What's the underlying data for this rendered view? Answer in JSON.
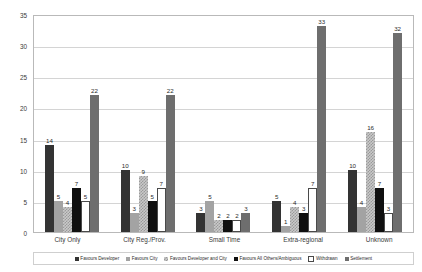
{
  "chart_data": {
    "type": "bar",
    "title": "",
    "subtitle": "",
    "xlabel": "",
    "ylabel": "",
    "ylim": [
      0,
      35
    ],
    "y_ticks": [
      0,
      5,
      10,
      15,
      20,
      25,
      30,
      35
    ],
    "grid": true,
    "legend_position": "bottom",
    "categories": [
      "City Only",
      "City Reg./Prov.",
      "Small Time",
      "Extra-regional",
      "Unknown"
    ],
    "series": [
      {
        "name": "Favours Developer",
        "color": "#333333",
        "values": [
          14,
          10,
          3,
          5,
          10
        ]
      },
      {
        "name": "Favours City",
        "color": "#a3a3a3",
        "values": [
          5,
          3,
          5,
          1,
          4
        ]
      },
      {
        "name": "Favours Developer and City",
        "color": "#c9c9c9",
        "values": [
          4,
          9,
          2,
          4,
          16
        ]
      },
      {
        "name": "Favours All Others/Ambiguous",
        "color": "#101010",
        "values": [
          7,
          5,
          2,
          3,
          7
        ]
      },
      {
        "name": "Withdrawn",
        "color": "#ffffff",
        "values": [
          5,
          7,
          2,
          7,
          3
        ]
      },
      {
        "name": "Settlement",
        "color": "#6e6e6e",
        "values": [
          22,
          22,
          3,
          33,
          32
        ]
      }
    ]
  }
}
